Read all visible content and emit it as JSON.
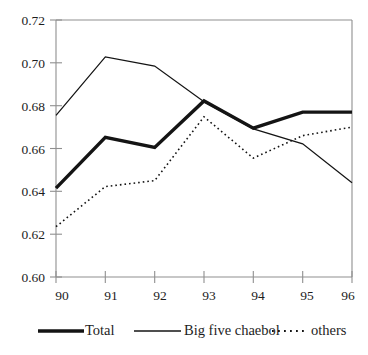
{
  "chart_data": {
    "type": "line",
    "title": "",
    "subtitle": "",
    "xlabel": "",
    "ylabel": "",
    "x": [
      "90",
      "91",
      "92",
      "93",
      "94",
      "95",
      "96"
    ],
    "categories": [
      "90",
      "91",
      "92",
      "93",
      "94",
      "95",
      "96"
    ],
    "xlim": [
      "90",
      "96"
    ],
    "ylim": [
      0.6,
      0.72
    ],
    "ytick_labels": [
      "0.72",
      "0.70",
      "0.68",
      "0.66",
      "0.64",
      "0.62",
      "0.60"
    ],
    "ytick_values": [
      0.72,
      0.7,
      0.68,
      0.66,
      0.64,
      0.62,
      0.6
    ],
    "xtick_labels": [
      "90",
      "91",
      "92",
      "93",
      "94",
      "95",
      "96"
    ],
    "grid": false,
    "legend_position": "bottom",
    "series": [
      {
        "name": "Total",
        "style": "thick-solid",
        "values": [
          0.6415,
          0.6652,
          0.6605,
          0.6822,
          0.6695,
          0.677,
          0.677
        ]
      },
      {
        "name": "Big five chaebol",
        "style": "thin-solid",
        "values": [
          0.6755,
          0.7028,
          0.6985,
          0.6818,
          0.6692,
          0.6622,
          0.644
        ]
      },
      {
        "name": "others",
        "style": "dotted",
        "values": [
          0.6235,
          0.6422,
          0.645,
          0.6748,
          0.6555,
          0.666,
          0.67
        ]
      }
    ],
    "legend": [
      {
        "label": "Total",
        "style": "thick-solid"
      },
      {
        "label": "Big five chaebol",
        "style": "thin-solid"
      },
      {
        "label": "others",
        "style": "dotted"
      }
    ]
  }
}
